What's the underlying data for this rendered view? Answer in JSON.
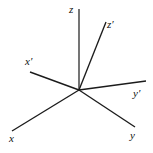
{
  "figure": {
    "name": "coordinate-axes-diagram",
    "background_color": "#ffffff",
    "width": 153,
    "height": 153,
    "origin": {
      "x": 79,
      "y": 90
    }
  },
  "colors": {
    "z_axis_gray": "#6f6f6f",
    "axis_dark": "#1b1b1b",
    "label_color": "#111111",
    "background": "#ffffff"
  },
  "axes": [
    {
      "id": "z",
      "label": "z",
      "frame": "unprimed",
      "color": "#6f6f6f",
      "stroke_width": 1.9,
      "x1": 79,
      "y1": 90,
      "x2": 79,
      "y2": 9,
      "label_x": 69,
      "label_y": 4
    },
    {
      "id": "x",
      "label": "x",
      "frame": "unprimed",
      "color": "#1b1b1b",
      "stroke_width": 1.35,
      "x1": 79,
      "y1": 90,
      "x2": 12,
      "y2": 131,
      "label_x": 9,
      "label_y": 133
    },
    {
      "id": "y",
      "label": "y",
      "frame": "unprimed",
      "color": "#1b1b1b",
      "stroke_width": 1.35,
      "x1": 79,
      "y1": 90,
      "x2": 135,
      "y2": 127,
      "label_x": 130,
      "label_y": 130
    },
    {
      "id": "z-prime",
      "label": "z′",
      "frame": "primed",
      "color": "#1b1b1b",
      "stroke_width": 1.35,
      "x1": 79,
      "y1": 90,
      "x2": 106,
      "y2": 22,
      "label_x": 107,
      "label_y": 19
    },
    {
      "id": "x-prime",
      "label": "x′",
      "frame": "primed",
      "color": "#1b1b1b",
      "stroke_width": 1.35,
      "x1": 79,
      "y1": 90,
      "x2": 30,
      "y2": 72,
      "label_x": 25,
      "label_y": 56
    },
    {
      "id": "y-prime",
      "label": "y′",
      "frame": "primed",
      "color": "#1b1b1b",
      "stroke_width": 1.35,
      "x1": 79,
      "y1": 90,
      "x2": 146,
      "y2": 81,
      "label_x": 133,
      "label_y": 88
    }
  ],
  "labels": {
    "z": "z",
    "x": "x",
    "y": "y",
    "z_prime": "z′",
    "x_prime": "x′",
    "y_prime": "y′"
  }
}
